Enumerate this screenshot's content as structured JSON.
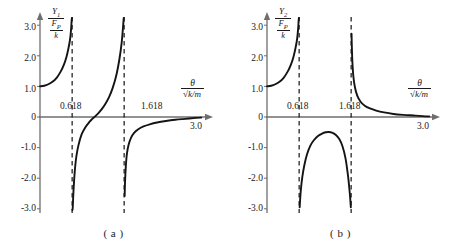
{
  "figure": {
    "background": "#ffffff",
    "curve_color": "#141414",
    "axis_color": "#6e6e6e",
    "asymptote_color": "#141414"
  },
  "panels": [
    {
      "caption": "( a )",
      "y_axis_title": {
        "numerator": "Y",
        "numerator_sub": "1",
        "denominator_num": "F",
        "denominator_sub": "P",
        "denominator_den": "k"
      },
      "x_axis_title": {
        "numerator": "θ",
        "denominator_radical": "√",
        "denominator_radicand": "k/m"
      },
      "y_ticks": [
        "3.0",
        "2.0",
        "1.0",
        "0",
        "-1.0",
        "-2.0",
        "-3.0"
      ],
      "x_ticks": [
        "0.618",
        "1.618",
        "3.0"
      ]
    },
    {
      "caption": "( b )",
      "y_axis_title": {
        "numerator": "Y",
        "numerator_sub": "2",
        "denominator_num": "F",
        "denominator_sub": "P",
        "denominator_den": "k"
      },
      "x_axis_title": {
        "numerator": "θ",
        "denominator_radical": "√",
        "denominator_radicand": "k/m"
      },
      "y_ticks": [
        "3.0",
        "2.0",
        "1.0",
        "0",
        "-1.0",
        "-2.0",
        "-3.0"
      ],
      "x_ticks": [
        "0.618",
        "1.618",
        "3.0"
      ]
    }
  ],
  "chart_data": [
    {
      "type": "line",
      "title": "",
      "panel": "(a)",
      "xlabel": "theta / sqrt(k/m)",
      "ylabel": "Y1 / (F_P / k)",
      "xlim": [
        0,
        3.2
      ],
      "ylim": [
        -3.4,
        3.4
      ],
      "grid": false,
      "legend": "none",
      "xticks": [
        0.618,
        1.618,
        3.0
      ],
      "xticklabels": [
        "0.618",
        "1.618",
        "3.0"
      ],
      "yticks": [
        -3.0,
        -2.0,
        -1.0,
        0,
        1.0,
        2.0,
        3.0
      ],
      "yticklabels": [
        "-3.0",
        "-2.0",
        "-1.0",
        "0",
        "1.0",
        "2.0",
        "3.0"
      ],
      "asymptotes": [
        0.618,
        1.618
      ],
      "series": [
        {
          "name": "branch-left",
          "x": [
            0.0,
            0.08,
            0.16,
            0.24,
            0.32,
            0.4,
            0.46,
            0.51,
            0.55,
            0.575,
            0.59,
            0.6,
            0.608,
            0.613
          ],
          "y": [
            1.0,
            1.02,
            1.07,
            1.15,
            1.28,
            1.49,
            1.71,
            1.97,
            2.27,
            2.5,
            2.72,
            2.92,
            3.15,
            3.35
          ]
        },
        {
          "name": "branch-middle",
          "x": [
            0.624,
            0.63,
            0.64,
            0.655,
            0.675,
            0.7,
            0.74,
            0.8,
            0.87,
            0.95,
            1.0,
            1.06,
            1.12,
            1.18,
            1.25,
            1.33,
            1.4,
            1.47,
            1.53,
            1.57,
            1.595,
            1.61
          ],
          "y": [
            -3.25,
            -2.95,
            -2.55,
            -2.1,
            -1.65,
            -1.28,
            -0.92,
            -0.57,
            -0.34,
            -0.16,
            -0.07,
            0.02,
            0.12,
            0.24,
            0.41,
            0.66,
            0.96,
            1.38,
            1.92,
            2.42,
            2.9,
            3.35
          ]
        },
        {
          "name": "branch-right",
          "x": [
            1.628,
            1.636,
            1.65,
            1.672,
            1.705,
            1.75,
            1.81,
            1.89,
            1.99,
            2.11,
            2.25,
            2.42,
            2.6,
            2.8,
            3.0,
            3.1
          ],
          "y": [
            -2.58,
            -2.1,
            -1.62,
            -1.2,
            -0.9,
            -0.68,
            -0.52,
            -0.4,
            -0.31,
            -0.24,
            -0.18,
            -0.13,
            -0.09,
            -0.06,
            -0.03,
            -0.02
          ]
        }
      ]
    },
    {
      "type": "line",
      "title": "",
      "panel": "(b)",
      "xlabel": "theta / sqrt(k/m)",
      "ylabel": "Y2 / (F_P / k)",
      "xlim": [
        0,
        3.2
      ],
      "ylim": [
        -3.4,
        3.4
      ],
      "grid": false,
      "legend": "none",
      "xticks": [
        0.618,
        1.618,
        3.0
      ],
      "xticklabels": [
        "0.618",
        "1.618",
        "3.0"
      ],
      "yticks": [
        -3.0,
        -2.0,
        -1.0,
        0,
        1.0,
        2.0,
        3.0
      ],
      "yticklabels": [
        "-3.0",
        "-2.0",
        "-1.0",
        "0",
        "1.0",
        "2.0",
        "3.0"
      ],
      "asymptotes": [
        0.618,
        1.618
      ],
      "series": [
        {
          "name": "branch-left",
          "x": [
            0.0,
            0.08,
            0.16,
            0.24,
            0.32,
            0.4,
            0.46,
            0.51,
            0.55,
            0.575,
            0.59,
            0.6,
            0.608,
            0.613
          ],
          "y": [
            1.0,
            1.02,
            1.07,
            1.15,
            1.28,
            1.49,
            1.71,
            1.97,
            2.27,
            2.5,
            2.72,
            2.92,
            3.15,
            3.35
          ]
        },
        {
          "name": "branch-middle-hump",
          "x": [
            0.628,
            0.65,
            0.68,
            0.72,
            0.77,
            0.83,
            0.9,
            0.98,
            1.06,
            1.13,
            1.19,
            1.25,
            1.32,
            1.39,
            1.45,
            1.51,
            1.56,
            1.595,
            1.612
          ],
          "y": [
            -2.95,
            -2.4,
            -1.95,
            -1.56,
            -1.22,
            -0.95,
            -0.76,
            -0.62,
            -0.54,
            -0.5,
            -0.49,
            -0.51,
            -0.58,
            -0.72,
            -0.95,
            -1.35,
            -1.95,
            -2.55,
            -2.95
          ]
        },
        {
          "name": "branch-right",
          "x": [
            1.626,
            1.632,
            1.642,
            1.66,
            1.69,
            1.735,
            1.8,
            1.88,
            1.98,
            2.1,
            2.25,
            2.43,
            2.62,
            2.82,
            3.0,
            3.12
          ],
          "y": [
            2.72,
            2.28,
            1.8,
            1.34,
            0.98,
            0.7,
            0.5,
            0.37,
            0.28,
            0.21,
            0.15,
            0.1,
            0.07,
            0.05,
            0.03,
            0.02
          ]
        }
      ]
    }
  ]
}
